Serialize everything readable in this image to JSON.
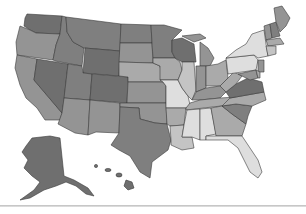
{
  "map": {
    "type": "choropleth",
    "region": "United States",
    "palette": {
      "darkest": "#6f6f6f",
      "dark": "#7f7f7f",
      "medium": "#949494",
      "light": "#aaaaaa",
      "lighter": "#c4c4c4",
      "lightest": "#dedede",
      "border": "#3a3a3a",
      "background": "#ffffff"
    },
    "states": [
      {
        "id": "WA",
        "shade": "darkest"
      },
      {
        "id": "OR",
        "shade": "medium"
      },
      {
        "id": "CA",
        "shade": "medium"
      },
      {
        "id": "ID",
        "shade": "dark"
      },
      {
        "id": "NV",
        "shade": "darkest"
      },
      {
        "id": "MT",
        "shade": "dark"
      },
      {
        "id": "WY",
        "shade": "darkest"
      },
      {
        "id": "UT",
        "shade": "dark"
      },
      {
        "id": "AZ",
        "shade": "medium"
      },
      {
        "id": "CO",
        "shade": "darkest"
      },
      {
        "id": "NM",
        "shade": "medium"
      },
      {
        "id": "ND",
        "shade": "dark"
      },
      {
        "id": "SD",
        "shade": "medium"
      },
      {
        "id": "NE",
        "shade": "light"
      },
      {
        "id": "KS",
        "shade": "medium"
      },
      {
        "id": "OK",
        "shade": "medium"
      },
      {
        "id": "TX",
        "shade": "dark"
      },
      {
        "id": "MN",
        "shade": "dark"
      },
      {
        "id": "IA",
        "shade": "light"
      },
      {
        "id": "MO",
        "shade": "lightest"
      },
      {
        "id": "AR",
        "shade": "light"
      },
      {
        "id": "LA",
        "shade": "lighter"
      },
      {
        "id": "WI",
        "shade": "darkest"
      },
      {
        "id": "IL",
        "shade": "lighter"
      },
      {
        "id": "MI",
        "shade": "medium"
      },
      {
        "id": "IN",
        "shade": "medium"
      },
      {
        "id": "OH",
        "shade": "light"
      },
      {
        "id": "KY",
        "shade": "medium"
      },
      {
        "id": "TN",
        "shade": "light"
      },
      {
        "id": "MS",
        "shade": "lightest"
      },
      {
        "id": "AL",
        "shade": "lightest"
      },
      {
        "id": "GA",
        "shade": "light"
      },
      {
        "id": "FL",
        "shade": "lightest"
      },
      {
        "id": "SC",
        "shade": "dark"
      },
      {
        "id": "NC",
        "shade": "light"
      },
      {
        "id": "VA",
        "shade": "darkest"
      },
      {
        "id": "WV",
        "shade": "light"
      },
      {
        "id": "PA",
        "shade": "lightest"
      },
      {
        "id": "NY",
        "shade": "lightest"
      },
      {
        "id": "VT",
        "shade": "medium"
      },
      {
        "id": "NH",
        "shade": "dark"
      },
      {
        "id": "ME",
        "shade": "medium"
      },
      {
        "id": "MA",
        "shade": "light"
      },
      {
        "id": "CT",
        "shade": "lighter"
      },
      {
        "id": "NJ",
        "shade": "medium"
      },
      {
        "id": "MD",
        "shade": "medium"
      },
      {
        "id": "DE",
        "shade": "light"
      },
      {
        "id": "AK",
        "shade": "darkest"
      },
      {
        "id": "HI",
        "shade": "darkest"
      }
    ]
  }
}
